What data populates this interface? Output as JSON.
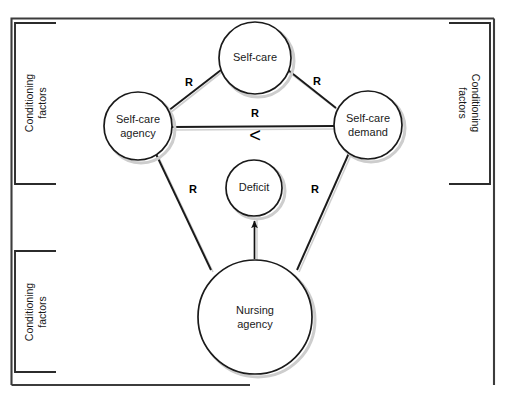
{
  "diagram": {
    "background_color": "#ffffff",
    "line_color": "#1a1a1a",
    "text_color": "#1a1a1a",
    "shadow_color": "#c9c9c9",
    "frame": {
      "present": true,
      "color": "#3a3a3a"
    },
    "nodes": [
      {
        "id": "self-care",
        "label_line1": "Self-care",
        "label_line2": "",
        "cx": 255,
        "cy": 58,
        "r": 36
      },
      {
        "id": "self-care-agency",
        "label_line1": "Self-care",
        "label_line2": "agency",
        "cx": 138,
        "cy": 126,
        "r": 34
      },
      {
        "id": "self-care-demand",
        "label_line1": "Self-care",
        "label_line2": "demand",
        "cx": 368,
        "cy": 125,
        "r": 34
      },
      {
        "id": "deficit",
        "label_line1": "Deficit",
        "label_line2": "",
        "cx": 254,
        "cy": 188,
        "r": 28
      },
      {
        "id": "nursing-agency",
        "label_line1": "Nursing",
        "label_line2": "agency",
        "cx": 255,
        "cy": 317,
        "r": 57
      }
    ],
    "edges": [
      {
        "id": "agency-to-selfcare",
        "label": "R",
        "label_x": 189,
        "label_y": 83
      },
      {
        "id": "selfcare-to-demand",
        "label": "R",
        "label_x": 317,
        "label_y": 82
      },
      {
        "id": "agency-to-demand",
        "label": "R",
        "label_x": 255,
        "label_y": 115
      },
      {
        "id": "agency-to-nursing",
        "label": "R",
        "label_x": 193,
        "label_y": 190
      },
      {
        "id": "demand-to-nursing",
        "label": "R",
        "label_x": 315,
        "label_y": 190
      }
    ],
    "relation_symbol": {
      "id": "less-than",
      "glyph": "<",
      "x": 255,
      "y": 136
    },
    "arrow": {
      "id": "nursing-to-deficit",
      "from": "nursing-agency",
      "to": "deficit"
    },
    "brackets": [
      {
        "id": "conditioning-factors-top-left",
        "label": "Conditioning factors",
        "line1": "Conditioning",
        "line2": "factors",
        "side": "left",
        "x": 14,
        "y_top": 22,
        "y_bottom": 185,
        "arm": 42,
        "rotation": -90
      },
      {
        "id": "conditioning-factors-bottom-left",
        "label": "Conditioning factors",
        "line1": "Conditioning",
        "line2": "factors",
        "side": "left",
        "x": 14,
        "y_top": 250,
        "y_bottom": 373,
        "arm": 42,
        "rotation": -90
      },
      {
        "id": "conditioning-factors-right",
        "label": "Conditioning factors",
        "line1": "Conditioning",
        "line2": "factors",
        "side": "right",
        "x": 490,
        "y_top": 22,
        "y_bottom": 185,
        "arm": 42,
        "rotation": 90
      }
    ]
  }
}
